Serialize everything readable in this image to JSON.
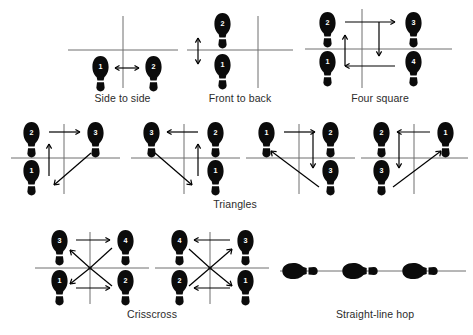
{
  "page": {
    "background_color": "#ffffff",
    "ink_color": "#0b0b0b",
    "line_color": "#6f6f6f"
  },
  "figures": [
    {
      "id": "side-to-side",
      "caption": "Side to side",
      "footprints": [
        {
          "label": "1",
          "position": "below-left"
        },
        {
          "label": "2",
          "position": "below-right"
        }
      ],
      "arrows": [
        {
          "type": "double",
          "direction": "horizontal",
          "between": [
            "1",
            "2"
          ]
        }
      ],
      "cross": "center-right"
    },
    {
      "id": "front-to-back",
      "caption": "Front to back",
      "footprints": [
        {
          "label": "2",
          "position": "above-left"
        },
        {
          "label": "1",
          "position": "below-left"
        }
      ],
      "arrows": [
        {
          "type": "double",
          "direction": "vertical",
          "between": [
            "1",
            "2"
          ]
        }
      ],
      "cross": "right"
    },
    {
      "id": "four-square",
      "caption": "Four square",
      "footprints": [
        {
          "label": "2",
          "position": "above-left"
        },
        {
          "label": "3",
          "position": "above-right"
        },
        {
          "label": "1",
          "position": "below-left"
        },
        {
          "label": "4",
          "position": "below-right"
        }
      ],
      "arrows": [
        {
          "type": "single",
          "direction": "up",
          "from": "1",
          "to": "2"
        },
        {
          "type": "single",
          "direction": "right",
          "from": "2",
          "to": "3"
        },
        {
          "type": "single",
          "direction": "down",
          "from": "3",
          "to": "4"
        },
        {
          "type": "single",
          "direction": "left",
          "from": "4",
          "to": "1"
        }
      ],
      "cross": "center"
    },
    {
      "id": "triangle-1",
      "caption": "",
      "footprints": [
        {
          "label": "2",
          "position": "above-left"
        },
        {
          "label": "3",
          "position": "above-right"
        },
        {
          "label": "1",
          "position": "below-left"
        }
      ],
      "arrows": [
        {
          "type": "single",
          "direction": "up",
          "from": "1",
          "to": "2"
        },
        {
          "type": "single",
          "direction": "right",
          "from": "2",
          "to": "3"
        },
        {
          "type": "single",
          "direction": "diagonal-down-left",
          "from": "3",
          "to": "1"
        }
      ],
      "cross": "center"
    },
    {
      "id": "triangle-2",
      "caption": "",
      "footprints": [
        {
          "label": "3",
          "position": "above-left"
        },
        {
          "label": "2",
          "position": "above-right"
        },
        {
          "label": "1",
          "position": "below-right"
        }
      ],
      "arrows": [
        {
          "type": "single",
          "direction": "up",
          "from": "1",
          "to": "2"
        },
        {
          "type": "single",
          "direction": "left",
          "from": "2",
          "to": "3"
        },
        {
          "type": "single",
          "direction": "diagonal-down-right",
          "from": "3",
          "to": "1"
        }
      ],
      "cross": "center"
    },
    {
      "id": "triangle-3",
      "caption": "",
      "footprints": [
        {
          "label": "1",
          "position": "above-left"
        },
        {
          "label": "2",
          "position": "above-right"
        },
        {
          "label": "3",
          "position": "below-right"
        }
      ],
      "arrows": [
        {
          "type": "single",
          "direction": "right",
          "from": "1",
          "to": "2"
        },
        {
          "type": "single",
          "direction": "down",
          "from": "2",
          "to": "3"
        },
        {
          "type": "single",
          "direction": "diagonal-up-left",
          "from": "3",
          "to": "1"
        }
      ],
      "cross": "center"
    },
    {
      "id": "triangle-4",
      "caption": "",
      "footprints": [
        {
          "label": "2",
          "position": "above-left"
        },
        {
          "label": "1",
          "position": "above-right"
        },
        {
          "label": "3",
          "position": "below-left"
        }
      ],
      "arrows": [
        {
          "type": "single",
          "direction": "left",
          "from": "1",
          "to": "2"
        },
        {
          "type": "single",
          "direction": "down",
          "from": "2",
          "to": "3"
        },
        {
          "type": "single",
          "direction": "diagonal-up-right",
          "from": "3",
          "to": "1"
        }
      ],
      "cross": "center"
    },
    {
      "id": "crisscross-1",
      "caption": "Crisscross",
      "footprints": [
        {
          "label": "3",
          "position": "above-left"
        },
        {
          "label": "4",
          "position": "above-right"
        },
        {
          "label": "1",
          "position": "below-left"
        },
        {
          "label": "2",
          "position": "below-right"
        }
      ],
      "arrows": [
        {
          "type": "single",
          "direction": "right",
          "from": "3",
          "to": "4"
        },
        {
          "type": "single",
          "direction": "right",
          "from": "1",
          "to": "2"
        },
        {
          "type": "single",
          "direction": "diagonal-up-left",
          "to": "3"
        },
        {
          "type": "single",
          "direction": "diagonal-up-right",
          "to": "4"
        },
        {
          "type": "single",
          "direction": "diagonal-down-left",
          "to": "1"
        }
      ],
      "cross": "center"
    },
    {
      "id": "crisscross-2",
      "caption": "",
      "footprints": [
        {
          "label": "4",
          "position": "above-left"
        },
        {
          "label": "3",
          "position": "above-right"
        },
        {
          "label": "2",
          "position": "below-left"
        },
        {
          "label": "1",
          "position": "below-right"
        }
      ],
      "arrows": [
        {
          "type": "single",
          "direction": "left",
          "from": "3",
          "to": "4"
        },
        {
          "type": "single",
          "direction": "left",
          "from": "1",
          "to": "2"
        },
        {
          "type": "single",
          "direction": "diagonal-up-right",
          "to": "3"
        },
        {
          "type": "single",
          "direction": "diagonal-down-right",
          "to": "1"
        },
        {
          "type": "single",
          "direction": "diagonal-down-left",
          "to": "2"
        }
      ],
      "cross": "center"
    },
    {
      "id": "straight-line-hop",
      "caption": "Straight-line hop",
      "footprints": [
        {
          "label": "",
          "position": "on-line-left",
          "orientation": "sideways"
        },
        {
          "label": "",
          "position": "on-line-center",
          "orientation": "sideways"
        },
        {
          "label": "",
          "position": "on-line-right",
          "orientation": "sideways"
        }
      ],
      "arrows": [],
      "cross": "none"
    }
  ],
  "captions": {
    "side_to_side": "Side to side",
    "front_to_back": "Front to back",
    "four_square": "Four square",
    "triangles": "Triangles",
    "crisscross": "Crisscross",
    "straight_line_hop": "Straight-line hop"
  }
}
